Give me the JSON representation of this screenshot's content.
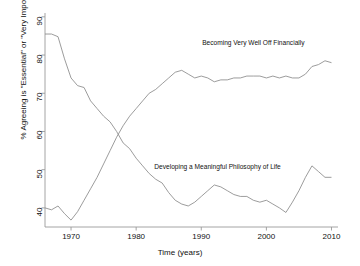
{
  "chart_data": {
    "type": "line",
    "title": "",
    "xlabel": "Time (years)",
    "ylabel": "% Agreeing is \"Essential\" or \"Very Important\"",
    "xlim": [
      1966,
      2011
    ],
    "ylim": [
      35,
      91
    ],
    "xticks": [
      1970,
      1980,
      1990,
      2000,
      2010
    ],
    "xtick_labels": [
      "1970",
      "1980",
      "1990",
      "2000",
      "2010"
    ],
    "yticks": [
      40,
      50,
      60,
      70,
      80,
      90
    ],
    "ytick_labels": [
      "40",
      "50",
      "60",
      "70",
      "80",
      "90"
    ],
    "grid": false,
    "legend_position": "inline-annotations",
    "line_color": "#8a8a8a",
    "axis_color": "#9a9a9a",
    "text_color": "#111111",
    "background": "#ffffff",
    "series": [
      {
        "name": "Developing a Meaningful Philosophy of Life",
        "annotation": "Developing a Meaningful Philosophy of Life",
        "annotation_x": 1992.5,
        "annotation_y": 50.5,
        "x": [
          1966,
          1967,
          1968,
          1969,
          1970,
          1971,
          1972,
          1973,
          1974,
          1975,
          1976,
          1977,
          1978,
          1979,
          1980,
          1981,
          1982,
          1983,
          1984,
          1985,
          1986,
          1987,
          1988,
          1989,
          1990,
          1991,
          1992,
          1993,
          1994,
          1995,
          1996,
          1997,
          1998,
          1999,
          2000,
          2001,
          2002,
          2003,
          2004,
          2005,
          2006,
          2007,
          2008,
          2009,
          2010
        ],
        "y": [
          85.5,
          85.5,
          84.8,
          79.0,
          74.0,
          72.0,
          71.5,
          68.0,
          66.0,
          64.0,
          62.5,
          60.0,
          57.0,
          55.5,
          53.0,
          51.0,
          49.0,
          47.5,
          46.5,
          44.0,
          42.0,
          41.0,
          40.5,
          41.5,
          43.0,
          44.5,
          46.0,
          45.5,
          44.5,
          43.5,
          43.0,
          43.0,
          42.0,
          41.5,
          42.0,
          41.0,
          40.0,
          38.8,
          41.5,
          44.5,
          48.0,
          51.0,
          49.5,
          48.0,
          48.0
        ]
      },
      {
        "name": "Becoming Very Well Off Financially",
        "annotation": "Becoming Very Well Off Financially",
        "annotation_x": 1998.0,
        "annotation_y": 83.0,
        "x": [
          1966,
          1967,
          1968,
          1969,
          1970,
          1971,
          1972,
          1973,
          1974,
          1975,
          1976,
          1977,
          1978,
          1979,
          1980,
          1981,
          1982,
          1983,
          1984,
          1985,
          1986,
          1987,
          1988,
          1989,
          1990,
          1991,
          1992,
          1993,
          1994,
          1995,
          1996,
          1997,
          1998,
          1999,
          2000,
          2001,
          2002,
          2003,
          2004,
          2005,
          2006,
          2007,
          2008,
          2009,
          2010
        ],
        "y": [
          40.0,
          39.5,
          40.5,
          38.5,
          36.8,
          39.0,
          42.0,
          45.0,
          48.0,
          51.5,
          55.0,
          58.5,
          61.5,
          64.0,
          66.0,
          68.0,
          70.0,
          71.0,
          72.5,
          74.0,
          75.5,
          76.0,
          75.0,
          74.0,
          74.5,
          74.0,
          73.0,
          73.5,
          73.5,
          74.0,
          74.0,
          74.5,
          74.5,
          74.5,
          74.0,
          74.5,
          74.0,
          74.5,
          74.0,
          74.0,
          75.0,
          77.0,
          77.5,
          78.5,
          78.0
        ]
      }
    ]
  }
}
